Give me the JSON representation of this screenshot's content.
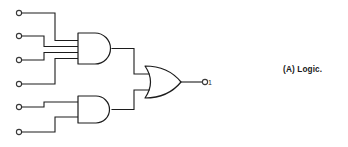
{
  "figure": {
    "caption": "(A) Logic.",
    "background_color": "#ffffff",
    "line_color": "#1c1c1c",
    "width": 348,
    "height": 147
  },
  "circuit": {
    "type": "logic-gate-diagram",
    "description": "Two AND gates feeding an OR gate",
    "input_terminals": [
      {
        "id": "in1",
        "cx": 19,
        "cy": 13,
        "r": 2.6
      },
      {
        "id": "in2",
        "cx": 19,
        "cy": 36,
        "r": 2.6
      },
      {
        "id": "in3",
        "cx": 19,
        "cy": 60,
        "r": 2.6
      },
      {
        "id": "in4",
        "cx": 19,
        "cy": 84,
        "r": 2.6
      },
      {
        "id": "in5",
        "cx": 19,
        "cy": 107,
        "r": 2.6
      },
      {
        "id": "in6",
        "cx": 19,
        "cy": 132,
        "r": 2.6
      }
    ],
    "output_terminal": {
      "id": "out1",
      "cx": 205,
      "cy": 82,
      "r": 2.6
    },
    "output_label": "1",
    "gates": [
      {
        "id": "and-gate-top",
        "type": "AND",
        "inputs": 4,
        "x": 78,
        "y": 33,
        "w": 34,
        "h": 31
      },
      {
        "id": "and-gate-bottom",
        "type": "AND",
        "inputs": 2,
        "x": 78,
        "y": 96,
        "w": 34,
        "h": 27
      },
      {
        "id": "or-gate",
        "type": "OR",
        "inputs": 2,
        "x": 145,
        "y": 66,
        "w": 36,
        "h": 32
      }
    ],
    "wires": [
      {
        "id": "wire-in1",
        "from": "in1",
        "to": "and-gate-top.in1",
        "path": "M21.5 13 L55 13 L55 40.5 L78 40.5"
      },
      {
        "id": "wire-in2",
        "from": "in2",
        "to": "and-gate-top.in2",
        "path": "M21.5 36 L44 36 L44 46.5 L78 46.5"
      },
      {
        "id": "wire-in3",
        "from": "in3",
        "to": "and-gate-top.in3",
        "path": "M21.5 60 L44 60 L44 52.5 L78 52.5"
      },
      {
        "id": "wire-in4",
        "from": "in4",
        "to": "and-gate-top.in4",
        "path": "M21.5 84 L55 84 L55 58.5 L78 58.5"
      },
      {
        "id": "wire-in5",
        "from": "in5",
        "to": "and-gate-bottom.in1",
        "path": "M21.5 107 L44 107 L44 102 L78 102"
      },
      {
        "id": "wire-in6",
        "from": "in6",
        "to": "and-gate-bottom.in2",
        "path": "M21.5 132 L55 132 L55 117 L78 117"
      },
      {
        "id": "wire-and-top-out",
        "from": "and-gate-top.out",
        "to": "or-gate.in1",
        "path": "M112 48.5 L134 48.5 L134 74 L148 74"
      },
      {
        "id": "wire-and-bottom-out",
        "from": "and-gate-bottom.out",
        "to": "or-gate.in2",
        "path": "M112 109.5 L134 109.5 L134 90 L148 90"
      },
      {
        "id": "wire-or-out",
        "from": "or-gate.out",
        "to": "out1",
        "path": "M181 82 L202.5 82"
      }
    ]
  }
}
